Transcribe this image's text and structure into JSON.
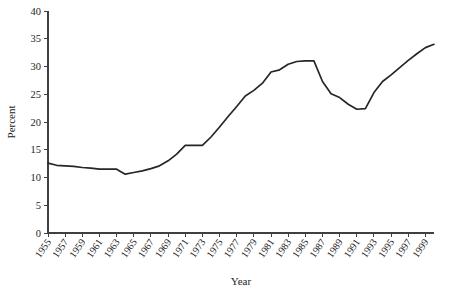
{
  "chart_data": {
    "type": "line",
    "title": "",
    "subtitle": "",
    "xlabel": "Year",
    "ylabel": "Percent",
    "xlim": [
      1955,
      2000
    ],
    "ylim": [
      0,
      40
    ],
    "ytick_step": 5,
    "xtick_step": 2,
    "grid": false,
    "legend": false,
    "legend_position": "none",
    "line_color": "#262626",
    "axis_color": "#404040",
    "background_color": "#ffffff",
    "ytick_labels": [
      "0",
      "5",
      "10",
      "15",
      "20",
      "25",
      "30",
      "35",
      "40"
    ],
    "ytick_values": [
      0,
      5,
      10,
      15,
      20,
      25,
      30,
      35,
      40
    ],
    "xtick_labels": [
      "1955",
      "1957",
      "1959",
      "1961",
      "1963",
      "1965",
      "1967",
      "1969",
      "1971",
      "1973",
      "1975",
      "1977",
      "1979",
      "1981",
      "1983",
      "1985",
      "1987",
      "1989",
      "1991",
      "1993",
      "1995",
      "1997",
      "1999"
    ],
    "xtick_values": [
      1955,
      1957,
      1959,
      1961,
      1963,
      1965,
      1967,
      1969,
      1971,
      1973,
      1975,
      1977,
      1979,
      1981,
      1983,
      1985,
      1987,
      1989,
      1991,
      1993,
      1995,
      1997,
      1999
    ],
    "x": [
      1955,
      1956,
      1957,
      1958,
      1959,
      1960,
      1961,
      1962,
      1963,
      1964,
      1965,
      1966,
      1967,
      1968,
      1969,
      1970,
      1971,
      1972,
      1973,
      1974,
      1975,
      1976,
      1977,
      1978,
      1979,
      1980,
      1981,
      1982,
      1983,
      1984,
      1985,
      1986,
      1987,
      1988,
      1989,
      1990,
      1991,
      1992,
      1993,
      1994,
      1995,
      1996,
      1997,
      1998,
      1999,
      2000
    ],
    "values": [
      12.6,
      12.2,
      12.1,
      12.0,
      11.8,
      11.7,
      11.5,
      11.5,
      11.5,
      10.6,
      10.9,
      11.2,
      11.6,
      12.1,
      13.0,
      14.2,
      15.8,
      15.8,
      15.8,
      17.3,
      19.1,
      21.0,
      22.8,
      24.7,
      25.7,
      27.0,
      29.0,
      29.4,
      30.4,
      30.9,
      31.0,
      31.0,
      27.3,
      25.1,
      24.4,
      23.2,
      22.3,
      22.4,
      25.3,
      27.3,
      28.5,
      29.8,
      31.1,
      32.3,
      33.4,
      34.0
    ],
    "series_name": "Percent",
    "annotations": []
  },
  "axis": {
    "y_title": "Percent",
    "x_title": "Year"
  }
}
